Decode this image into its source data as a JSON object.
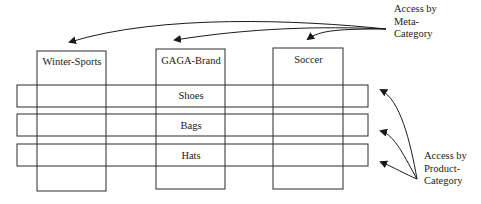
{
  "diagram": {
    "meta_categories": [
      {
        "label": "Winter-Sports"
      },
      {
        "label": "GAGA-Brand"
      },
      {
        "label": "Soccer"
      }
    ],
    "product_categories": [
      {
        "label": "Shoes"
      },
      {
        "label": "Bags"
      },
      {
        "label": "Hats"
      }
    ],
    "annotations": {
      "meta": {
        "line1": "Access by",
        "line2": "Meta-",
        "line3": "Category"
      },
      "product": {
        "line1": "Access by",
        "line2": "Product-",
        "line3": "Category"
      }
    },
    "colors": {
      "stroke": "#2a2a2a",
      "background": "#ffffff"
    }
  }
}
